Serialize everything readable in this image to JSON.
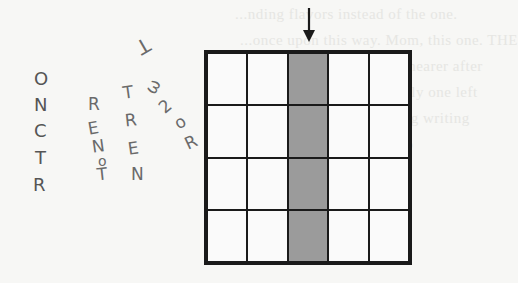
{
  "diagram": {
    "type": "grid-with-arrow",
    "grid": {
      "columns": 5,
      "rows": 4,
      "shaded_column_index": 2,
      "colors": {
        "border": "#1a1a1a",
        "cell": "#fafafa",
        "shaded": "#9b9b9b"
      }
    },
    "arrow": {
      "direction": "down",
      "points_to_column": 2,
      "color": "#1a1a1a"
    },
    "handwriting": {
      "vertical_column": [
        "O",
        "N",
        "C",
        "T",
        "R"
      ],
      "scattered": {
        "col1": [
          "R",
          "E",
          "N",
          "o",
          "T"
        ],
        "col2": [
          "T",
          "R",
          "E",
          "N"
        ],
        "diagonal": [
          "T",
          "ω",
          "2",
          "o",
          "R"
        ]
      }
    },
    "background_text": [
      "...nding flavors instead of the one.",
      "...once upon this way. Mom, this one. THE",
      "...es's per reflecting ahd the nearer after",
      "...ong Ricardo's ever. the only one left",
      "...s very much. Swing reading writing",
      "...n that Deadlines stay as inco"
    ]
  }
}
